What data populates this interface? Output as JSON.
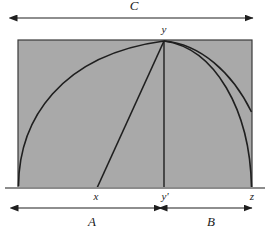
{
  "figure": {
    "title": "",
    "background_color": "#ffffff",
    "fill_color": "#a9a9a9",
    "stroke_color": "#1f1f1f",
    "baseline_color": "#808080",
    "labels": {
      "top_dimension": "C",
      "left_dimension": "A",
      "right_dimension": "B",
      "apex_point": "y",
      "foot_point": "y'",
      "left_point": "x",
      "right_point": "z"
    },
    "geometry": {
      "rect_left": 18,
      "rect_right": 252,
      "rect_top": 40,
      "rect_bottom": 188,
      "apex_x": 164,
      "baseline_y": 188,
      "baseline_left": 5,
      "baseline_right": 265,
      "point_x": 97,
      "point_z": 252,
      "right_arc_edge_y": 112,
      "top_arrow_y": 18,
      "top_arrow_left": 17,
      "top_arrow_right": 253,
      "bottom_arrow_y": 208,
      "bottom_arrow_a_left": 18,
      "bottom_arrow_a_right": 162,
      "bottom_arrow_b_left": 167,
      "bottom_arrow_b_right": 252
    }
  }
}
